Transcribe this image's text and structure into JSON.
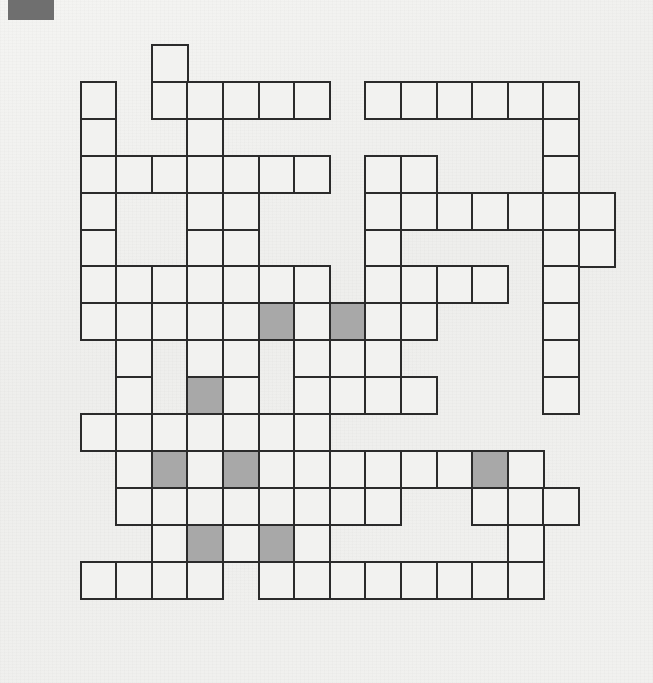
{
  "page": {
    "width": 653,
    "height": 683,
    "background_color": "#f0f0ee"
  },
  "corner_mark": {
    "name": "scan-corner-mark",
    "color": "#6f6f6f",
    "x": 8,
    "y": 0,
    "width": 46,
    "height": 20
  },
  "grid": {
    "columns": 16,
    "rows": 16,
    "origin_x": 44,
    "origin_y": 44,
    "cell_width": 35.6,
    "cell_height": 36.9,
    "line_color": "#2b2b2b",
    "line_width": 2.2,
    "empty_cell_color": "#f2f2f0",
    "shaded_cell_color": "#a8a8a8",
    "legend": "1 = open (white) square, 2 = shaded (grey) square, 0 = no square",
    "cells": [
      [
        0,
        0,
        0,
        1,
        0,
        0,
        0,
        0,
        0,
        0,
        0,
        0,
        0,
        0,
        0,
        0
      ],
      [
        0,
        1,
        0,
        1,
        1,
        1,
        1,
        1,
        0,
        1,
        1,
        1,
        1,
        1,
        1,
        0
      ],
      [
        0,
        1,
        0,
        0,
        1,
        0,
        0,
        0,
        0,
        0,
        0,
        0,
        0,
        0,
        1,
        0
      ],
      [
        0,
        1,
        1,
        1,
        1,
        1,
        1,
        1,
        0,
        1,
        1,
        0,
        0,
        0,
        1,
        0
      ],
      [
        0,
        1,
        0,
        0,
        1,
        1,
        0,
        0,
        0,
        1,
        1,
        1,
        1,
        1,
        1,
        1
      ],
      [
        0,
        1,
        0,
        0,
        1,
        1,
        0,
        0,
        0,
        1,
        0,
        0,
        0,
        0,
        1,
        1
      ],
      [
        0,
        1,
        1,
        1,
        1,
        1,
        1,
        1,
        0,
        1,
        1,
        1,
        1,
        0,
        1,
        0
      ],
      [
        0,
        1,
        1,
        1,
        1,
        1,
        2,
        1,
        2,
        1,
        1,
        0,
        0,
        0,
        1,
        0
      ],
      [
        0,
        0,
        1,
        0,
        1,
        1,
        0,
        1,
        1,
        1,
        0,
        0,
        0,
        0,
        1,
        0
      ],
      [
        0,
        0,
        1,
        0,
        2,
        1,
        0,
        1,
        1,
        1,
        1,
        0,
        0,
        0,
        1,
        0
      ],
      [
        0,
        1,
        1,
        1,
        1,
        1,
        1,
        1,
        0,
        0,
        0,
        0,
        0,
        0,
        0,
        0
      ],
      [
        0,
        0,
        1,
        2,
        1,
        2,
        1,
        1,
        1,
        1,
        1,
        1,
        2,
        1,
        0,
        0
      ],
      [
        0,
        0,
        1,
        1,
        1,
        1,
        1,
        1,
        1,
        1,
        0,
        0,
        1,
        1,
        1,
        0
      ],
      [
        0,
        0,
        0,
        1,
        2,
        1,
        2,
        1,
        0,
        0,
        0,
        0,
        0,
        1,
        0,
        0
      ],
      [
        0,
        1,
        1,
        1,
        1,
        0,
        1,
        1,
        1,
        1,
        1,
        1,
        1,
        1,
        0,
        0
      ],
      [
        0,
        0,
        0,
        0,
        0,
        0,
        0,
        0,
        0,
        0,
        0,
        0,
        0,
        0,
        0,
        0
      ]
    ]
  }
}
